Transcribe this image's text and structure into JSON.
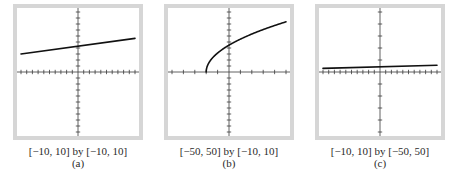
{
  "chart_data": [
    {
      "type": "line",
      "title": "",
      "window_label": "[−10, 10] by [−10, 10]",
      "panel_label": "(a)",
      "xlim": [
        -10,
        10
      ],
      "ylim": [
        -10,
        10
      ],
      "xscale_tick": 1,
      "yscale_tick": 1,
      "grid": false,
      "xlabel": "",
      "ylabel": "",
      "series": [
        {
          "name": "f",
          "x": [
            -10,
            10
          ],
          "y": [
            3.0,
            5.6
          ],
          "function_estimate": "y = 0.13x + 4.3"
        }
      ]
    },
    {
      "type": "line",
      "title": "",
      "window_label": "[−50, 50] by [−10, 10]",
      "panel_label": "(b)",
      "xlim": [
        -50,
        50
      ],
      "ylim": [
        -10,
        10
      ],
      "xscale_tick": 10,
      "yscale_tick": 1,
      "grid": false,
      "xlabel": "",
      "ylabel": "",
      "series": [
        {
          "name": "f",
          "function_estimate": "y = sqrt(x + 20)",
          "x": [
            -20,
            -19,
            -17,
            -15,
            -10,
            -5,
            0,
            10,
            20,
            30,
            40,
            50
          ],
          "y": [
            0,
            1.0,
            1.73,
            2.24,
            3.16,
            3.87,
            4.47,
            5.48,
            6.32,
            7.07,
            7.75,
            8.37
          ]
        }
      ]
    },
    {
      "type": "line",
      "title": "",
      "window_label": "[−10, 10] by [−50, 50]",
      "panel_label": "(c)",
      "xlim": [
        -10,
        10
      ],
      "ylim": [
        -50,
        50
      ],
      "xscale_tick": 1,
      "yscale_tick": 10,
      "grid": false,
      "xlabel": "",
      "ylabel": "",
      "series": [
        {
          "name": "f",
          "x": [
            -10,
            10
          ],
          "y": [
            3.0,
            5.6
          ],
          "function_estimate": "y = 0.13x + 4.3"
        }
      ]
    }
  ],
  "colors": {
    "frame": "#d6d6d6",
    "axis": "#3a3a3a",
    "curve": "#111111"
  }
}
